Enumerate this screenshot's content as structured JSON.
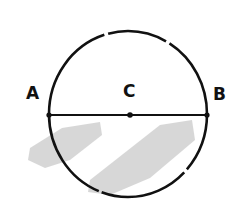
{
  "diagram": {
    "type": "circle-with-diameter",
    "points": [
      {
        "id": "A",
        "label": "A",
        "x": 49,
        "y": 115
      },
      {
        "id": "C",
        "label": "C",
        "x": 130,
        "y": 115
      },
      {
        "id": "B",
        "label": "B",
        "x": 207,
        "y": 115
      }
    ],
    "circle": {
      "cx": 128,
      "cy": 114,
      "rx": 79,
      "ry": 83,
      "stroke": "#111111"
    },
    "diameter": {
      "from": "A",
      "to": "B"
    },
    "shading_color": "#b8b8b8"
  }
}
